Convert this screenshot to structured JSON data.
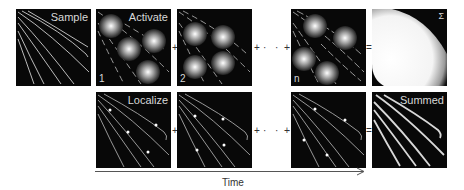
{
  "figure": {
    "top_row": {
      "panels": [
        {
          "id": "sample",
          "label": "Sample",
          "index": ""
        },
        {
          "id": "activate-1",
          "label": "Activate",
          "index": "1"
        },
        {
          "id": "activate-2",
          "label": "",
          "index": "2"
        },
        {
          "id": "activate-n",
          "label": "",
          "index": "n"
        },
        {
          "id": "sum",
          "label": "Σ",
          "index": ""
        }
      ]
    },
    "bottom_row": {
      "panels": [
        {
          "id": "localize-1",
          "label": "Localize"
        },
        {
          "id": "localize-2",
          "label": ""
        },
        {
          "id": "localize-n",
          "label": ""
        },
        {
          "id": "summed",
          "label": "Summed"
        }
      ]
    },
    "operators": {
      "plus": "+",
      "dots": "· · ·",
      "equals": "="
    },
    "time_axis": {
      "label": "Time"
    },
    "colors": {
      "panel_bg": "#080808",
      "filament": "#cfcfcf",
      "text": "#d8d8d8",
      "axis": "#555555"
    }
  }
}
